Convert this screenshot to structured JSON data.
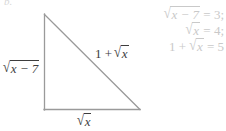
{
  "figure": {
    "crop_mark": "b.",
    "background_color": "#ffffff",
    "stroke_color": "#9a9a9a",
    "label_color": "#3d3d3d",
    "faint_color": "#c9c9c9",
    "triangle": {
      "apex": [
        44,
        14
      ],
      "bottom_left": [
        44,
        110
      ],
      "bottom_right": [
        140,
        110
      ]
    },
    "labels": {
      "leg_vertical": {
        "radical_sign": "√",
        "radicand": "x − 7",
        "plain": "√(x − 7)"
      },
      "hypotenuse": {
        "prefix": "1 +",
        "radical_sign": "√",
        "radicand": "x",
        "plain": "1 + √x"
      },
      "leg_horizontal": {
        "radical_sign": "√",
        "radicand": "x",
        "plain": "√x"
      }
    }
  },
  "equations": [
    {
      "radical_sign": "√",
      "radicand": "x − 7",
      "prefix": "",
      "relation": "=",
      "value": "3;",
      "plain": "√(x − 7) = 3;"
    },
    {
      "radical_sign": "√",
      "radicand": "x",
      "prefix": "",
      "relation": "=",
      "value": "4;",
      "plain": "√x = 4;"
    },
    {
      "radical_sign": "√",
      "radicand": "x",
      "prefix": "1 +",
      "relation": "=",
      "value": "5",
      "plain": "1 + √x = 5"
    }
  ]
}
